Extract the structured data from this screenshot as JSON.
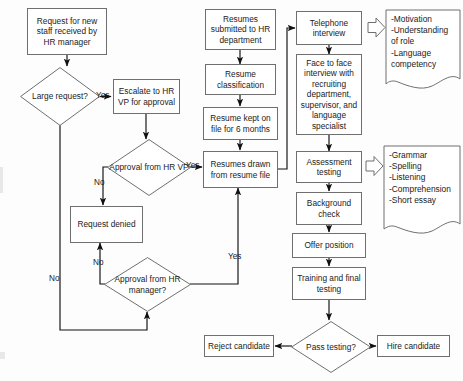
{
  "diagram": {
    "type": "flowchart",
    "colors": {
      "stroke": "#6f6f6f",
      "arrow": "#101010",
      "text": "#1b1b1b",
      "background": "#ffffff"
    },
    "nodes": [
      {
        "id": "request-new-staff",
        "shape": "box",
        "label": "Request for new staff received by HR manager"
      },
      {
        "id": "large-request",
        "shape": "diamond",
        "label": "Large request?"
      },
      {
        "id": "escalate-hr-vp",
        "shape": "box",
        "label": "Escalate to HR VP for approval"
      },
      {
        "id": "approval-hr-vp",
        "shape": "diamond",
        "label": "Approval from HR VP"
      },
      {
        "id": "request-denied",
        "shape": "box",
        "label": "Request denied"
      },
      {
        "id": "approval-hr-manager",
        "shape": "diamond",
        "label": "Approval from HR manager?"
      },
      {
        "id": "resumes-submitted",
        "shape": "box",
        "label": "Resumes submitted to HR department"
      },
      {
        "id": "resume-classification",
        "shape": "box",
        "label": "Resume classification"
      },
      {
        "id": "resume-kept",
        "shape": "box",
        "label": "Resume kept on file for 6 months"
      },
      {
        "id": "resumes-drawn",
        "shape": "box",
        "label": "Resumes drawn from resume file"
      },
      {
        "id": "telephone-interview",
        "shape": "box",
        "label": "Telephone interview"
      },
      {
        "id": "face-to-face",
        "shape": "box",
        "label": "Face to face interview with recruiting department, supervisor, and language specialist"
      },
      {
        "id": "assessment-testing",
        "shape": "box",
        "label": "Assessment testing"
      },
      {
        "id": "background-check",
        "shape": "box",
        "label": "Background check"
      },
      {
        "id": "offer-position",
        "shape": "box",
        "label": "Offer position"
      },
      {
        "id": "training-final",
        "shape": "box",
        "label": "Training and final testing"
      },
      {
        "id": "pass-testing",
        "shape": "diamond",
        "label": "Pass testing?"
      },
      {
        "id": "reject-candidate",
        "shape": "box",
        "label": "Reject candidate"
      },
      {
        "id": "hire-candidate",
        "shape": "box",
        "label": "Hire candidate"
      }
    ],
    "notes": [
      {
        "id": "telephone-note",
        "attached_to": "telephone-interview",
        "text": "-Motivation\n-Understanding\n  of role\n-Language\n  competency"
      },
      {
        "id": "assessment-note",
        "attached_to": "assessment-testing",
        "text": "-Grammar\n-Spelling\n-Listening\n-Comprehension\n-Short essay"
      }
    ],
    "edge_labels": [
      {
        "id": "large-request-yes",
        "text": "Yes"
      },
      {
        "id": "large-request-no",
        "text": "No"
      },
      {
        "id": "approval-vp-yes",
        "text": "Yes"
      },
      {
        "id": "approval-vp-no",
        "text": "No"
      },
      {
        "id": "approval-mgr-yes",
        "text": "Yes"
      },
      {
        "id": "approval-mgr-no",
        "text": "No"
      }
    ]
  }
}
